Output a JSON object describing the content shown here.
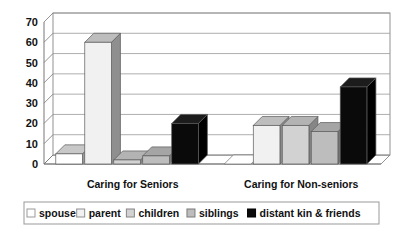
{
  "chart_data": {
    "type": "bar",
    "title": "",
    "subtitle": "",
    "xlabel": "",
    "ylabel": "",
    "categories": [
      "Caring for Seniors",
      "Caring for Non-seniors"
    ],
    "series": [
      {
        "name": "spouse",
        "values": [
          5,
          0
        ],
        "color": "#ffffff",
        "side_color": "#9a9a9a",
        "top_color": "#c8c8c8"
      },
      {
        "name": "parent",
        "values": [
          60,
          19
        ],
        "color": "#f1f1f1",
        "side_color": "#8f8f8f",
        "top_color": "#bdbdbd"
      },
      {
        "name": "children",
        "values": [
          2,
          19
        ],
        "color": "#d2d2d2",
        "side_color": "#868686",
        "top_color": "#b3b3b3"
      },
      {
        "name": "siblings",
        "values": [
          4,
          16
        ],
        "color": "#bdbdbd",
        "side_color": "#7a7a7a",
        "top_color": "#a5a5a5"
      },
      {
        "name": "distant kin & friends",
        "values": [
          20,
          38
        ],
        "color": "#0a0a0a",
        "side_color": "#000000",
        "top_color": "#1c1c1c"
      }
    ],
    "ylim": [
      0,
      70
    ],
    "yticks": [
      0,
      10,
      20,
      30,
      40,
      50,
      60,
      70
    ],
    "ytick_labels": [
      "0",
      "10",
      "20",
      "30",
      "40",
      "50",
      "60",
      "70"
    ],
    "grid": true,
    "grid_axis": "y",
    "legend_position": "bottom",
    "style": "3d-bar",
    "plot_background": "#ffffff",
    "axis_color": "#777777",
    "grid_color": "#999999",
    "legend_border_color": "#999999",
    "text_color": "#111111"
  },
  "legend": {
    "items": [
      {
        "label": "spouse"
      },
      {
        "label": "parent"
      },
      {
        "label": "children"
      },
      {
        "label": "siblings"
      },
      {
        "label": "distant kin & friends"
      }
    ]
  }
}
